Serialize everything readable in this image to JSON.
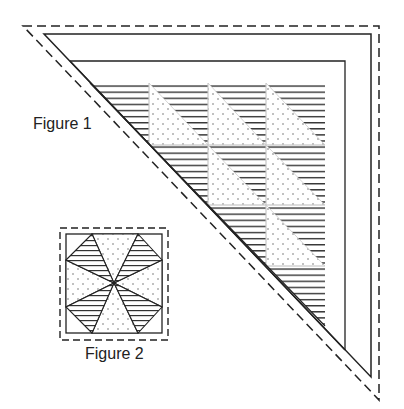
{
  "figure1": {
    "label": "Figure 1",
    "label_pos": {
      "x": 33,
      "y": 115
    },
    "outer_dashed": [
      [
        23,
        26
      ],
      [
        379,
        26
      ],
      [
        379,
        400
      ]
    ],
    "outer_solid": [
      [
        44,
        34
      ],
      [
        371,
        34
      ],
      [
        371,
        377
      ]
    ],
    "inner_solid": [
      [
        70,
        61
      ],
      [
        345,
        61
      ],
      [
        345,
        350
      ]
    ],
    "grid": {
      "x0": 90,
      "y0": 83,
      "cols": [
        90,
        149,
        208,
        266,
        325
      ],
      "rows": [
        83,
        145,
        205,
        266,
        326
      ]
    },
    "dotted_cells": [
      [
        0,
        1
      ],
      [
        0,
        2
      ],
      [
        0,
        3
      ],
      [
        1,
        2
      ],
      [
        1,
        3
      ],
      [
        2,
        3
      ]
    ],
    "line_color": "#222222"
  },
  "figure2": {
    "label": "Figure 2",
    "label_pos": {
      "x": 85,
      "y": 345
    },
    "dashed_square": {
      "x": 60,
      "y": 228,
      "w": 108,
      "h": 112
    },
    "solid_square": {
      "x": 66,
      "y": 234,
      "w": 96,
      "h": 99
    },
    "center": [
      114,
      283
    ]
  }
}
